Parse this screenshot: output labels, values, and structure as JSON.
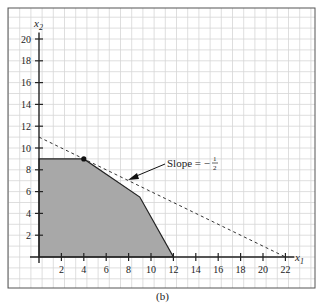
{
  "chart_data": {
    "type": "area",
    "title": "",
    "caption": "(b)",
    "xlabel": "x1",
    "ylabel": "x2",
    "xlabel_main": "x",
    "xlabel_sub": "1",
    "ylabel_main": "x",
    "ylabel_sub": "2",
    "xlim": [
      0,
      22
    ],
    "ylim": [
      0,
      20
    ],
    "x_ticks": [
      2,
      4,
      6,
      8,
      10,
      12,
      14,
      16,
      18,
      20,
      22
    ],
    "y_ticks": [
      2,
      4,
      6,
      8,
      10,
      12,
      14,
      16,
      18,
      20
    ],
    "grid": true,
    "feasible_region": {
      "name": "Feasible region",
      "vertices": [
        [
          0,
          0
        ],
        [
          0,
          9
        ],
        [
          4,
          9
        ],
        [
          9,
          5.5
        ],
        [
          12,
          0
        ]
      ],
      "fill": "#a8a8a8"
    },
    "objective_line": {
      "name": "Iso-objective line",
      "points": [
        [
          0,
          11
        ],
        [
          22,
          0
        ]
      ],
      "style": "dashed",
      "slope": -0.5
    },
    "optimal_point": {
      "x": 4,
      "y": 9
    },
    "annotation": {
      "text": "Slope = −",
      "fraction_num": "1",
      "fraction_den": "2",
      "arrow_to": [
        8,
        7
      ]
    }
  }
}
